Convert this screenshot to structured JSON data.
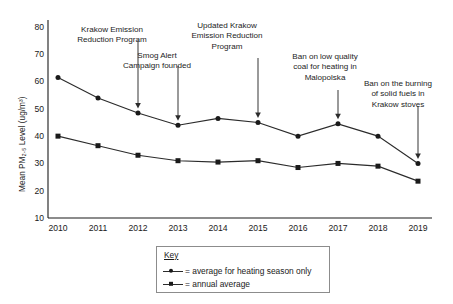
{
  "chart_data": {
    "type": "line",
    "title": "",
    "xlabel": "",
    "ylabel": "Mean PM2.5 Level (ug/m3)",
    "ylabel_rich": "Mean PM₂.₅ Level (ug/m³)",
    "categories": [
      "2010",
      "2011",
      "2012",
      "2013",
      "2014",
      "2015",
      "2016",
      "2017",
      "2018",
      "2019"
    ],
    "ylim": [
      10,
      80
    ],
    "yticks": [
      10,
      20,
      30,
      40,
      50,
      60,
      70,
      80
    ],
    "grid": false,
    "legend_position": "below-right",
    "series": [
      {
        "name": "average for heating season only",
        "marker": "circle",
        "values": [
          61.5,
          54.0,
          48.5,
          44.0,
          46.5,
          45.0,
          40.0,
          44.5,
          40.0,
          30.0
        ]
      },
      {
        "name": "annual average",
        "marker": "square",
        "values": [
          40.0,
          36.5,
          33.0,
          31.0,
          30.5,
          31.0,
          28.5,
          30.0,
          29.0,
          23.5
        ]
      }
    ],
    "annotations": [
      {
        "text": "Krakow Emission Reduction Program",
        "year": "2012",
        "target_series": 0
      },
      {
        "text": "Smog Alert Campaign founded",
        "year": "2013",
        "target_series": 0
      },
      {
        "text": "Updated Krakow Emission Reduction Program",
        "year": "2015",
        "target_series": 0
      },
      {
        "text": "Ban on low quality coal for heating in Malopolska",
        "year": "2017",
        "target_series": 0
      },
      {
        "text": "Ban on the burning of solid fuels in Krakow stoves",
        "year": "2019",
        "target_series": 0
      }
    ]
  },
  "legend": {
    "title": "Key",
    "entries": [
      {
        "marker": "circle",
        "label": "= average for heating season only"
      },
      {
        "marker": "square",
        "label": "= annual average"
      }
    ]
  },
  "axis": {
    "y_title": "Mean PM₂.₅ Level (ug/m³)",
    "y_tick_labels": [
      "80",
      "70",
      "60",
      "50",
      "40",
      "30",
      "20",
      "10"
    ],
    "x_tick_labels": [
      "2010",
      "2011",
      "2012",
      "2013",
      "2014",
      "2015",
      "2016",
      "2017",
      "2018",
      "2019"
    ]
  },
  "annotation_texts": {
    "a0_l1": "Krakow Emission",
    "a0_l2": "Reduction Program",
    "a1_l1": "Smog Alert",
    "a1_l2": "Campaign founded",
    "a2_l1": "Updated Krakow",
    "a2_l2": "Emission Reduction",
    "a2_l3": "Program",
    "a3_l1": "Ban on low quality",
    "a3_l2": "coal for heating in",
    "a3_l3": "Malopolska",
    "a4_l1": "Ban on the burning",
    "a4_l2": "of solid fuels in",
    "a4_l3": "Krakow stoves"
  },
  "colors": {
    "line": "#2b2b2b",
    "marker": "#1a1a1a",
    "axis": "#1a1a1a",
    "text": "#1a1a1a",
    "legend_border": "#8c8c8c",
    "background": "#ffffff"
  }
}
